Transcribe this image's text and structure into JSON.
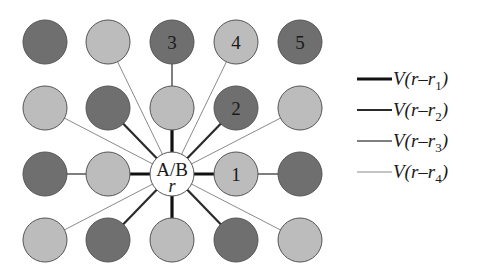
{
  "colors": {
    "dark": "#6f6f6f",
    "light": "#bcbcbc",
    "center": "#ffffff",
    "outline": "#555555"
  },
  "grid": {
    "columns_x": [
      45,
      108,
      172,
      236,
      300
    ],
    "rows_y": [
      42,
      108,
      174,
      240
    ],
    "radius": 22
  },
  "nodes": [
    {
      "col": 0,
      "row": 0,
      "shade": "dark",
      "label": ""
    },
    {
      "col": 1,
      "row": 0,
      "shade": "light",
      "label": ""
    },
    {
      "col": 2,
      "row": 0,
      "shade": "dark",
      "label": "3"
    },
    {
      "col": 3,
      "row": 0,
      "shade": "light",
      "label": "4"
    },
    {
      "col": 4,
      "row": 0,
      "shade": "dark",
      "label": "5"
    },
    {
      "col": 0,
      "row": 1,
      "shade": "light",
      "label": ""
    },
    {
      "col": 1,
      "row": 1,
      "shade": "dark",
      "label": ""
    },
    {
      "col": 2,
      "row": 1,
      "shade": "light",
      "label": ""
    },
    {
      "col": 3,
      "row": 1,
      "shade": "dark",
      "label": "2"
    },
    {
      "col": 4,
      "row": 1,
      "shade": "light",
      "label": ""
    },
    {
      "col": 0,
      "row": 2,
      "shade": "dark",
      "label": ""
    },
    {
      "col": 1,
      "row": 2,
      "shade": "light",
      "label": ""
    },
    {
      "col": 3,
      "row": 2,
      "shade": "light",
      "label": "1"
    },
    {
      "col": 4,
      "row": 2,
      "shade": "dark",
      "label": ""
    },
    {
      "col": 0,
      "row": 3,
      "shade": "light",
      "label": ""
    },
    {
      "col": 1,
      "row": 3,
      "shade": "dark",
      "label": ""
    },
    {
      "col": 2,
      "row": 3,
      "shade": "light",
      "label": ""
    },
    {
      "col": 3,
      "row": 3,
      "shade": "dark",
      "label": ""
    },
    {
      "col": 4,
      "row": 3,
      "shade": "light",
      "label": ""
    }
  ],
  "center_node": {
    "col": 2,
    "row": 2,
    "label": "A/B",
    "sublabel": "r"
  },
  "bond_styles": {
    "r1": {
      "width": 3.2,
      "color": "#111111"
    },
    "r2": {
      "width": 2.2,
      "color": "#2a2a2a"
    },
    "r3": {
      "width": 1.5,
      "color": "#555555"
    },
    "r4": {
      "width": 1.0,
      "color": "#8a8a8a"
    }
  },
  "bonds": [
    {
      "from": [
        2,
        2
      ],
      "to": [
        2,
        1
      ],
      "type": "r1"
    },
    {
      "from": [
        2,
        2
      ],
      "to": [
        1,
        2
      ],
      "type": "r1"
    },
    {
      "from": [
        2,
        2
      ],
      "to": [
        3,
        2
      ],
      "type": "r1"
    },
    {
      "from": [
        2,
        2
      ],
      "to": [
        2,
        3
      ],
      "type": "r1"
    },
    {
      "from": [
        2,
        2
      ],
      "to": [
        1,
        1
      ],
      "type": "r2"
    },
    {
      "from": [
        2,
        2
      ],
      "to": [
        3,
        1
      ],
      "type": "r2"
    },
    {
      "from": [
        2,
        2
      ],
      "to": [
        1,
        3
      ],
      "type": "r2"
    },
    {
      "from": [
        2,
        2
      ],
      "to": [
        3,
        3
      ],
      "type": "r2"
    },
    {
      "from": [
        2,
        1
      ],
      "to": [
        2,
        0
      ],
      "type": "r3"
    },
    {
      "from": [
        1,
        2
      ],
      "to": [
        0,
        2
      ],
      "type": "r3"
    },
    {
      "from": [
        3,
        2
      ],
      "to": [
        4,
        2
      ],
      "type": "r3"
    },
    {
      "from": [
        2,
        2
      ],
      "to": [
        1,
        0
      ],
      "type": "r4"
    },
    {
      "from": [
        2,
        2
      ],
      "to": [
        3,
        0
      ],
      "type": "r4"
    },
    {
      "from": [
        2,
        2
      ],
      "to": [
        0,
        1
      ],
      "type": "r4"
    },
    {
      "from": [
        2,
        2
      ],
      "to": [
        4,
        1
      ],
      "type": "r4"
    },
    {
      "from": [
        2,
        2
      ],
      "to": [
        0,
        3
      ],
      "type": "r4"
    },
    {
      "from": [
        2,
        2
      ],
      "to": [
        4,
        3
      ],
      "type": "r4"
    }
  ],
  "legend": {
    "items": [
      {
        "type": "r1",
        "prefix": "V(r–r",
        "sub": "1",
        "suffix": ")"
      },
      {
        "type": "r2",
        "prefix": "V(r–r",
        "sub": "2",
        "suffix": ")"
      },
      {
        "type": "r3",
        "prefix": "V(r–r",
        "sub": "3",
        "suffix": ")"
      },
      {
        "type": "r4",
        "prefix": "V(r–r",
        "sub": "4",
        "suffix": ")"
      }
    ],
    "x_line_start": 357,
    "x_line_end": 392,
    "x_text": 393,
    "rows_y": [
      79,
      110,
      141,
      172
    ]
  }
}
